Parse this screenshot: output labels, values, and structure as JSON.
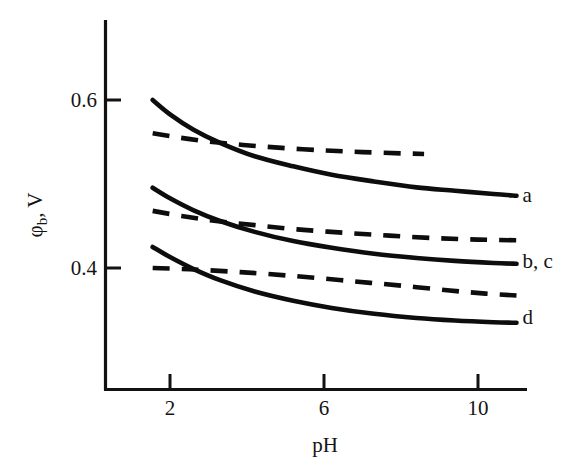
{
  "chart_data": {
    "type": "line",
    "title": "",
    "subtitle": "",
    "xlabel": "pH",
    "ylabel": "φb, V",
    "ylabel_main": "φ",
    "ylabel_sub": "b",
    "ylabel_unit": ", V",
    "xlim": [
      1.0,
      11.4
    ],
    "ylim": [
      0.28,
      0.625
    ],
    "xticks": [
      2,
      6,
      10
    ],
    "xtick_labels": [
      "2",
      "6",
      "10"
    ],
    "yticks": [
      0.4,
      0.6
    ],
    "ytick_labels": [
      "0.4",
      "0.6"
    ],
    "grid": false,
    "legend_position": "right-of-axes",
    "axis_color": "#121212",
    "curve_color": "#0d0d0d",
    "background_color": "#ffffff",
    "annotations": [
      {
        "name": "label-a",
        "text": "a",
        "x": 11.0,
        "y": 0.487
      },
      {
        "name": "label-bc",
        "text": "b, c",
        "x": 11.0,
        "y": 0.408
      },
      {
        "name": "label-d",
        "text": "d",
        "x": 11.0,
        "y": 0.342
      }
    ],
    "series": [
      {
        "name": "a",
        "label": "a",
        "style": "solid",
        "x": [
          1.55,
          2.0,
          2.6,
          3.3,
          4.2,
          5.2,
          6.2,
          7.3,
          8.4,
          9.4,
          10.4,
          11.0
        ],
        "values": [
          0.6,
          0.583,
          0.565,
          0.549,
          0.533,
          0.521,
          0.511,
          0.503,
          0.496,
          0.492,
          0.488,
          0.486
        ]
      },
      {
        "name": "a-dashed",
        "label": "a (dashed)",
        "style": "dashed",
        "x": [
          1.55,
          2.2,
          3.0,
          3.9,
          4.9,
          6.0,
          7.0,
          8.0,
          8.6
        ],
        "values": [
          0.5605,
          0.5555,
          0.5505,
          0.5465,
          0.543,
          0.54,
          0.538,
          0.5365,
          0.5358
        ]
      },
      {
        "name": "b",
        "label": "b",
        "style": "solid",
        "x": [
          1.55,
          2.0,
          2.6,
          3.3,
          4.2,
          5.2,
          6.2,
          7.3,
          8.4,
          9.4,
          10.4,
          11.0
        ],
        "values": [
          0.4955,
          0.483,
          0.469,
          0.456,
          0.443,
          0.432,
          0.424,
          0.417,
          0.412,
          0.4085,
          0.406,
          0.405
        ]
      },
      {
        "name": "c",
        "label": "c",
        "style": "dashed",
        "x": [
          1.55,
          2.3,
          3.2,
          4.2,
          5.3,
          6.5,
          7.7,
          8.9,
          10.0,
          11.0
        ],
        "values": [
          0.468,
          0.462,
          0.456,
          0.451,
          0.446,
          0.442,
          0.4385,
          0.4355,
          0.4338,
          0.433
        ]
      },
      {
        "name": "d",
        "label": "d",
        "style": "solid",
        "x": [
          1.55,
          2.0,
          2.6,
          3.3,
          4.2,
          5.2,
          6.2,
          7.3,
          8.4,
          9.4,
          10.4,
          11.0
        ],
        "values": [
          0.425,
          0.413,
          0.399,
          0.3855,
          0.372,
          0.361,
          0.3525,
          0.3455,
          0.3405,
          0.3375,
          0.3355,
          0.3348
        ]
      },
      {
        "name": "d-dashed",
        "label": "d (dashed)",
        "style": "dashed",
        "x": [
          1.55,
          2.5,
          3.5,
          4.5,
          5.6,
          6.8,
          8.0,
          9.2,
          10.2,
          11.0
        ],
        "values": [
          0.4,
          0.3985,
          0.396,
          0.393,
          0.389,
          0.384,
          0.379,
          0.3735,
          0.3695,
          0.3672
        ]
      }
    ]
  },
  "figure": {
    "caption": ""
  }
}
